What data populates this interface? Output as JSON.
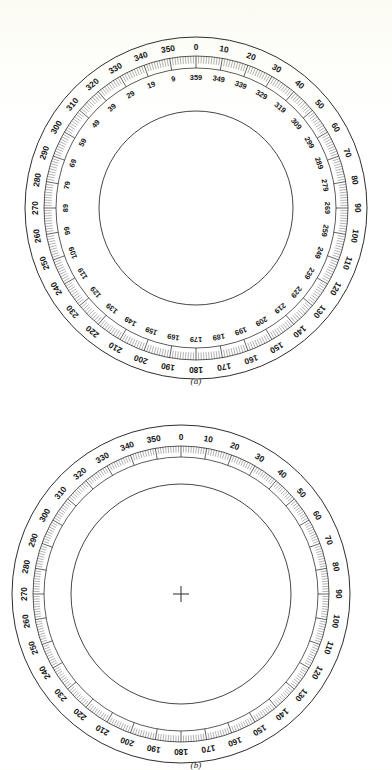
{
  "document": {
    "background_color": "#fdfdf7",
    "ink_color": "#161616",
    "figure_count": 2
  },
  "figures": [
    {
      "id": "a",
      "caption": "(a)",
      "name": "dual-scale-compass-dial",
      "center": {
        "x": 196,
        "y": 186
      },
      "radii": {
        "outer_rim": 171,
        "tick_outer": 152,
        "tick_inner": 140,
        "inner_circle": 97
      },
      "has_crosshair": false,
      "scales": [
        {
          "name": "outer-scale",
          "direction": "clockwise",
          "step": 10,
          "start": 0,
          "labels": [
            "0",
            "10",
            "20",
            "30",
            "40",
            "50",
            "60",
            "70",
            "80",
            "90",
            "100",
            "110",
            "120",
            "130",
            "140",
            "150",
            "160",
            "170",
            "180",
            "190",
            "200",
            "210",
            "220",
            "230",
            "240",
            "250",
            "260",
            "270",
            "280",
            "290",
            "300",
            "310",
            "320",
            "330",
            "340",
            "350"
          ]
        },
        {
          "name": "inner-reciprocal-scale",
          "direction": "counterclockwise",
          "step": 10,
          "start": 359,
          "labels": [
            "359",
            "349",
            "339",
            "329",
            "319",
            "309",
            "299",
            "289",
            "279",
            "269",
            "259",
            "249",
            "239",
            "229",
            "219",
            "209",
            "199",
            "189",
            "179",
            "169",
            "159",
            "149",
            "139",
            "129",
            "119",
            "109",
            "99",
            "89",
            "79",
            "69",
            "59",
            "49",
            "39",
            "29",
            "19",
            "9"
          ]
        }
      ],
      "tick_marks": {
        "minor_step": 1,
        "minor_count": 360,
        "major_step": 10
      }
    },
    {
      "id": "b",
      "caption": "(b)",
      "center": {
        "x": 181,
        "y": 184
      },
      "name": "single-scale-compass-dial",
      "radii": {
        "outer_rim": 169,
        "tick_outer": 148,
        "tick_inner": 137,
        "inner_circle": 110
      },
      "has_crosshair": true,
      "crosshair_size": 16,
      "scales": [
        {
          "name": "outer-scale",
          "direction": "clockwise",
          "step": 10,
          "start": 0,
          "labels": [
            "0",
            "10",
            "20",
            "30",
            "40",
            "50",
            "60",
            "70",
            "80",
            "90",
            "100",
            "110",
            "120",
            "130",
            "140",
            "150",
            "160",
            "170",
            "180",
            "190",
            "200",
            "210",
            "220",
            "230",
            "240",
            "250",
            "260",
            "270",
            "280",
            "290",
            "300",
            "310",
            "320",
            "330",
            "340",
            "350"
          ]
        }
      ],
      "tick_marks": {
        "minor_step": 1,
        "minor_count": 360,
        "major_step": 10
      }
    }
  ]
}
